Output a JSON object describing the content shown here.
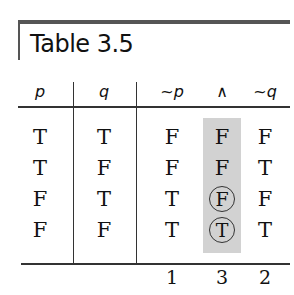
{
  "table": {
    "title": "Table 3.5",
    "headers": [
      "p",
      "q",
      "~p",
      "∧",
      "~q"
    ],
    "rows": [
      [
        "T",
        "T",
        "F",
        "F",
        "F"
      ],
      [
        "T",
        "F",
        "F",
        "F",
        "T"
      ],
      [
        "F",
        "T",
        "T",
        "F",
        "F"
      ],
      [
        "F",
        "F",
        "T",
        "T",
        "T"
      ]
    ],
    "circled": [
      [
        2,
        3
      ],
      [
        3,
        3
      ]
    ],
    "shaded_column": 3,
    "step_numbers": [
      "1",
      "3",
      "2"
    ],
    "shade_color": "#d2d2d2"
  }
}
